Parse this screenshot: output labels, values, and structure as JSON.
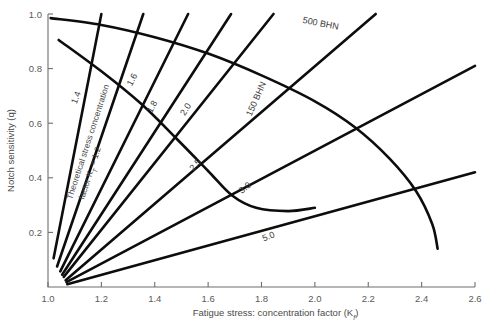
{
  "chart_data": {
    "type": "line",
    "title": "",
    "xlabel": "Fatigue stress: concentration factor (K",
    "xlabel_sub": "f",
    "xlabel_end": ")",
    "ylabel": "Notch sensitivity (q)",
    "xlim": [
      1.0,
      2.6
    ],
    "ylim": [
      0.0,
      1.0
    ],
    "xticks": [
      "1.0",
      "1.2",
      "1.4",
      "1.6",
      "1.8",
      "2.0",
      "2.2",
      "2.4",
      "2.6"
    ],
    "xtick_values": [
      1.0,
      1.2,
      1.4,
      1.6,
      1.8,
      2.0,
      2.2,
      2.4,
      2.6
    ],
    "yticks": [
      "1.0",
      "0.8",
      "0.6",
      "0.4",
      "0.2"
    ],
    "ytick_values": [
      1.0,
      0.8,
      0.6,
      0.4,
      0.2
    ],
    "grid": false,
    "legend_position": "inline-labels",
    "annotation_kt": "Theoretical stress concentration",
    "annotation_kt_line2": "factor K",
    "annotation_kt_sub": "T",
    "annotation_kt_line2b": " = 1.2",
    "series": [
      {
        "name": "1.2",
        "label": "",
        "kt": 1.2,
        "points": [
          [
            1.021,
            0.105
          ],
          [
            1.2,
            1.0
          ]
        ]
      },
      {
        "name": "1.4",
        "label": "1.4",
        "kt": 1.4,
        "points": [
          [
            1.034,
            0.075
          ],
          [
            1.357,
            1.0
          ]
        ]
      },
      {
        "name": "1.6",
        "label": "1.6",
        "kt": 1.6,
        "points": [
          [
            1.046,
            0.057
          ],
          [
            1.525,
            1.0
          ]
        ]
      },
      {
        "name": "1.8",
        "label": "1.8",
        "kt": 1.8,
        "points": [
          [
            1.053,
            0.045
          ],
          [
            1.686,
            1.0
          ]
        ]
      },
      {
        "name": "2.0",
        "label": "2.0",
        "kt": 2.0,
        "points": [
          [
            1.059,
            0.037
          ],
          [
            1.845,
            1.0
          ]
        ]
      },
      {
        "name": "2.5",
        "label": "2.5",
        "kt": 2.5,
        "points": [
          [
            1.066,
            0.025
          ],
          [
            2.228,
            1.0
          ]
        ]
      },
      {
        "name": "3.0",
        "label": "3.0",
        "kt": 3.0,
        "points": [
          [
            1.069,
            0.018
          ],
          [
            2.6,
            0.81
          ]
        ]
      },
      {
        "name": "5.0",
        "label": "5.0",
        "kt": 5.0,
        "points": [
          [
            1.072,
            0.01
          ],
          [
            2.6,
            0.42
          ]
        ]
      }
    ],
    "bhn_curves": [
      {
        "name": "500 BHN",
        "label": "500 BHN",
        "points": [
          [
            1.01,
            0.985
          ],
          [
            1.2,
            0.96
          ],
          [
            1.4,
            0.915
          ],
          [
            1.6,
            0.855
          ],
          [
            1.8,
            0.775
          ],
          [
            2.0,
            0.68
          ],
          [
            2.15,
            0.585
          ],
          [
            2.28,
            0.47
          ],
          [
            2.38,
            0.35
          ],
          [
            2.44,
            0.23
          ],
          [
            2.46,
            0.14
          ]
        ]
      },
      {
        "name": "150 BHN",
        "label": "150 BHN",
        "points": [
          [
            1.04,
            0.905
          ],
          [
            1.2,
            0.79
          ],
          [
            1.35,
            0.67
          ],
          [
            1.48,
            0.545
          ],
          [
            1.6,
            0.425
          ],
          [
            1.69,
            0.335
          ],
          [
            1.78,
            0.29
          ],
          [
            1.9,
            0.278
          ],
          [
            2.0,
            0.29
          ]
        ]
      }
    ],
    "bhn_label_positions": [
      {
        "text": "500 BHN",
        "x": 2.02,
        "y": 0.955,
        "rotate": -11
      },
      {
        "text": "150 BHN",
        "x": 1.79,
        "y": 0.685,
        "rotate": 66
      }
    ],
    "curve_label_positions": [
      {
        "text": "1.4",
        "x": 1.115,
        "y": 0.69,
        "rotate": 69
      },
      {
        "text": "1.6",
        "x": 1.325,
        "y": 0.755,
        "rotate": 62
      },
      {
        "text": "1.8",
        "x": 1.4,
        "y": 0.655,
        "rotate": 61
      },
      {
        "text": "2.0",
        "x": 1.525,
        "y": 0.645,
        "rotate": 57
      },
      {
        "text": "2.5",
        "x": 1.56,
        "y": 0.44,
        "rotate": 47
      },
      {
        "text": "3.0",
        "x": 1.745,
        "y": 0.355,
        "rotate": 38
      },
      {
        "text": "5.0",
        "x": 1.83,
        "y": 0.175,
        "rotate": 22
      }
    ]
  }
}
